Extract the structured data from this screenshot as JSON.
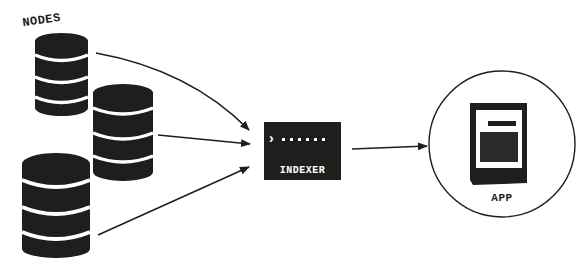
{
  "diagram": {
    "nodes_label": "NODES",
    "indexer_label": "INDEXER",
    "app_label": "APP",
    "terminal_prompt": "›",
    "terminal_dots": "......",
    "databases": [
      {
        "id": "db1",
        "label": "node-1"
      },
      {
        "id": "db2",
        "label": "node-2"
      },
      {
        "id": "db3",
        "label": "node-3"
      }
    ],
    "edges": [
      {
        "from": "db1",
        "to": "indexer"
      },
      {
        "from": "db2",
        "to": "indexer"
      },
      {
        "from": "db3",
        "to": "indexer"
      },
      {
        "from": "indexer",
        "to": "app"
      }
    ],
    "colors": {
      "ink": "#1e1e1e",
      "background": "#ffffff",
      "band": "#ffffff"
    }
  }
}
